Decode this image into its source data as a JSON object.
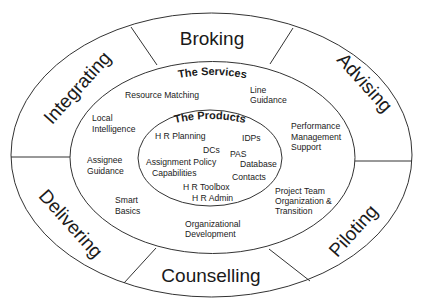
{
  "diagram": {
    "outer_ring": {
      "segments": [
        {
          "label": "Broking"
        },
        {
          "label": "Advising"
        },
        {
          "label": "Piloting"
        },
        {
          "label": "Counselling"
        },
        {
          "label": "Delivering"
        },
        {
          "label": "Integrating"
        }
      ]
    },
    "services": {
      "title": "The Services",
      "items": [
        {
          "lines": [
            "Resource Matching"
          ]
        },
        {
          "lines": [
            "Line",
            "Guidance"
          ]
        },
        {
          "lines": [
            "Local",
            "Intelligence"
          ]
        },
        {
          "lines": [
            "Performance",
            "Management",
            "Support"
          ]
        },
        {
          "lines": [
            "Assignee",
            "Guidance"
          ]
        },
        {
          "lines": [
            "Smart",
            "Basics"
          ]
        },
        {
          "lines": [
            "Project Team",
            "Organization &",
            "Transition"
          ]
        },
        {
          "lines": [
            "Organizational",
            "Development"
          ]
        }
      ]
    },
    "products": {
      "title": "The Products",
      "items": [
        {
          "label": "H R Planning"
        },
        {
          "label": "IDPs"
        },
        {
          "label": "DCs"
        },
        {
          "label": "PAS"
        },
        {
          "label": "Assignment Policy"
        },
        {
          "label": "Database"
        },
        {
          "label": "Capabilities"
        },
        {
          "label": "Contacts"
        },
        {
          "label": "H R Toolbox"
        },
        {
          "label": "H R Admin"
        }
      ]
    },
    "colors": {
      "stroke": "#333333",
      "text": "#1a1a1a",
      "background": "#ffffff"
    }
  }
}
